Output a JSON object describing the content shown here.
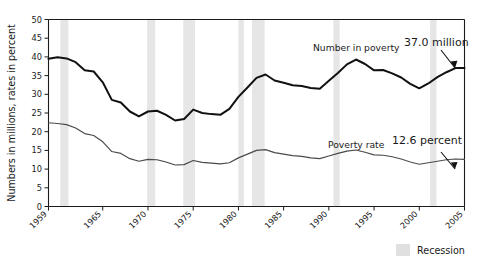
{
  "chart_data": {
    "type": "line",
    "title": "",
    "xlabel": "",
    "ylabel": "Numbers in millions, rates in percent",
    "ylim": [
      0,
      50
    ],
    "xlim": [
      1959,
      2005
    ],
    "ytick_labels": [
      "0",
      "5",
      "10",
      "15",
      "20",
      "25",
      "30",
      "35",
      "40",
      "45",
      "50"
    ],
    "ytick_values": [
      0,
      5,
      10,
      15,
      20,
      25,
      30,
      35,
      40,
      45,
      50
    ],
    "xtick_labels": [
      "1959",
      "1965",
      "1970",
      "1975",
      "1980",
      "1985",
      "1990",
      "1995",
      "2000",
      "2005"
    ],
    "xtick_values": [
      1959,
      1965,
      1970,
      1975,
      1980,
      1985,
      1990,
      1995,
      2000,
      2005
    ],
    "grid": false,
    "legend_position": "bottom-right",
    "x": [
      1959,
      1960,
      1961,
      1962,
      1963,
      1964,
      1965,
      1966,
      1967,
      1968,
      1969,
      1970,
      1971,
      1972,
      1973,
      1974,
      1975,
      1976,
      1977,
      1978,
      1979,
      1980,
      1981,
      1982,
      1983,
      1984,
      1985,
      1986,
      1987,
      1988,
      1989,
      1990,
      1991,
      1992,
      1993,
      1994,
      1995,
      1996,
      1997,
      1998,
      1999,
      2000,
      2001,
      2002,
      2003,
      2004,
      2005
    ],
    "series": [
      {
        "name": "Number in poverty",
        "units": "millions",
        "color": "#111111",
        "values": [
          39.5,
          39.9,
          39.6,
          38.6,
          36.4,
          36.1,
          33.2,
          28.5,
          27.8,
          25.4,
          24.1,
          25.4,
          25.6,
          24.5,
          23.0,
          23.4,
          25.9,
          25.0,
          24.7,
          24.5,
          26.1,
          29.3,
          31.8,
          34.4,
          35.3,
          33.7,
          33.1,
          32.4,
          32.2,
          31.7,
          31.5,
          33.6,
          35.7,
          38.0,
          39.3,
          38.1,
          36.4,
          36.5,
          35.6,
          34.5,
          32.8,
          31.6,
          32.9,
          34.6,
          35.9,
          37.0,
          37.0
        ]
      },
      {
        "name": "Poverty rate",
        "units": "percent",
        "color": "#4a4a4a",
        "values": [
          22.4,
          22.2,
          21.9,
          21.0,
          19.5,
          19.0,
          17.3,
          14.7,
          14.2,
          12.8,
          12.1,
          12.6,
          12.5,
          11.9,
          11.1,
          11.2,
          12.3,
          11.8,
          11.6,
          11.4,
          11.7,
          13.0,
          14.0,
          15.0,
          15.2,
          14.4,
          14.0,
          13.6,
          13.4,
          13.0,
          12.8,
          13.5,
          14.2,
          14.8,
          15.1,
          14.5,
          13.8,
          13.7,
          13.3,
          12.7,
          11.9,
          11.3,
          11.7,
          12.1,
          12.5,
          12.7,
          12.6
        ]
      }
    ],
    "annotations": [
      {
        "id": "number-in-poverty-label",
        "text": "Number in poverty"
      },
      {
        "id": "number-in-poverty-value",
        "text": "37.0 million"
      },
      {
        "id": "poverty-rate-label",
        "text": "Poverty rate"
      },
      {
        "id": "poverty-rate-value",
        "text": "12.6 percent"
      }
    ],
    "recessions": [
      {
        "start": 1960.3,
        "end": 1961.2
      },
      {
        "start": 1969.9,
        "end": 1970.8
      },
      {
        "start": 1973.9,
        "end": 1975.2
      },
      {
        "start": 1980.0,
        "end": 1980.6
      },
      {
        "start": 1981.5,
        "end": 1982.9
      },
      {
        "start": 1990.5,
        "end": 1991.2
      },
      {
        "start": 2001.2,
        "end": 2001.9
      }
    ],
    "legend": {
      "recession_label": "Recession",
      "recession_color": "#e0e0e0"
    }
  }
}
